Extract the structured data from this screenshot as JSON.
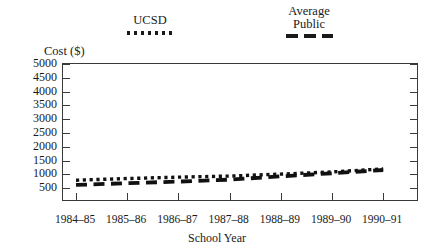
{
  "chart_data": {
    "type": "line",
    "title": "",
    "xlabel": "School Year",
    "ylabel": "Cost ($)",
    "categories": [
      "1984–85",
      "1985–86",
      "1986–87",
      "1987–88",
      "1988–89",
      "1989–90",
      "1990–91"
    ],
    "x": [
      1984,
      1985,
      1986,
      1987,
      1988,
      1989,
      1990
    ],
    "ylim": [
      0,
      5000
    ],
    "yticks": [
      500,
      1000,
      1500,
      2000,
      2500,
      3000,
      3500,
      4000,
      4500,
      5000
    ],
    "ytick_labels": [
      "500",
      "1000",
      "1500",
      "2000",
      "2500",
      "3000",
      "3500",
      "4000",
      "4500",
      "5000"
    ],
    "grid": false,
    "legend_position": "above-plot",
    "series": [
      {
        "name": "UCSD",
        "style": "dotted",
        "color": "#111111",
        "values": [
          790,
          850,
          900,
          940,
          1010,
          1090,
          1200
        ]
      },
      {
        "name": "Average Public",
        "style": "dashed",
        "color": "#111111",
        "values": [
          620,
          680,
          740,
          810,
          930,
          1040,
          1160
        ]
      }
    ]
  },
  "legend": {
    "ucsd": {
      "label": "UCSD",
      "swatch": "dotted-line-swatch"
    },
    "public": {
      "line1": "Average",
      "line2": "Public",
      "swatch": "dashed-line-swatch"
    }
  },
  "axes": {
    "y_title": "Cost ($)",
    "x_title": "School Year"
  }
}
